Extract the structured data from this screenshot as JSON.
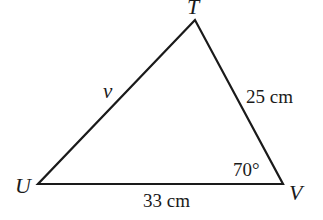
{
  "diagram": {
    "type": "triangle",
    "vertices": {
      "T": {
        "label": "T",
        "x": 195,
        "y": 20
      },
      "U": {
        "label": "U",
        "x": 38,
        "y": 184
      },
      "V": {
        "label": "V",
        "x": 283,
        "y": 184
      }
    },
    "sides": {
      "UT": {
        "label": "v"
      },
      "TV": {
        "label": "25 cm"
      },
      "UV": {
        "label": "33 cm"
      }
    },
    "angles": {
      "V": {
        "label": "70°"
      }
    },
    "stroke_color": "#1a1a1a"
  }
}
